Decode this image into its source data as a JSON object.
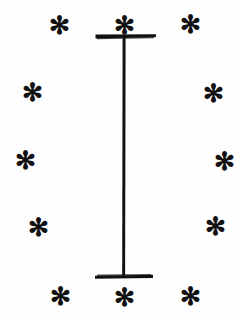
{
  "figure": {
    "background_color": "#fefefe",
    "ink_color": "#111111",
    "beam": {
      "name": "i-beam",
      "stroke_color": "#111111",
      "stem": {
        "x": 124,
        "y_top": 36,
        "y_bottom": 278,
        "width": 3
      },
      "top_flange": {
        "x_left": 95,
        "x_right": 156,
        "y": 36,
        "thickness": 4
      },
      "bottom_flange": {
        "x_left": 95,
        "x_right": 153,
        "y": 277,
        "thickness": 4
      }
    },
    "marker_glyph": "✻",
    "marker_count": 12,
    "markers": [
      {
        "name": "asterisk-top-left",
        "glyph": "✻",
        "x": 59,
        "y": 21,
        "size": 25
      },
      {
        "name": "asterisk-top-center",
        "glyph": "✻",
        "x": 124,
        "y": 21,
        "size": 25
      },
      {
        "name": "asterisk-top-right",
        "glyph": "✻",
        "x": 190,
        "y": 20,
        "size": 25
      },
      {
        "name": "asterisk-upper-left",
        "glyph": "✻",
        "x": 32,
        "y": 88,
        "size": 25
      },
      {
        "name": "asterisk-upper-right",
        "glyph": "✻",
        "x": 213,
        "y": 89,
        "size": 25
      },
      {
        "name": "asterisk-middle-left",
        "glyph": "✻",
        "x": 25,
        "y": 156,
        "size": 25
      },
      {
        "name": "asterisk-middle-right",
        "glyph": "✻",
        "x": 224,
        "y": 157,
        "size": 25
      },
      {
        "name": "asterisk-lower-left",
        "glyph": "✻",
        "x": 38,
        "y": 223,
        "size": 25
      },
      {
        "name": "asterisk-lower-right",
        "glyph": "✻",
        "x": 215,
        "y": 222,
        "size": 25
      },
      {
        "name": "asterisk-bottom-left",
        "glyph": "✻",
        "x": 60,
        "y": 292,
        "size": 25
      },
      {
        "name": "asterisk-bottom-center",
        "glyph": "✻",
        "x": 124,
        "y": 293,
        "size": 25
      },
      {
        "name": "asterisk-bottom-right",
        "glyph": "✻",
        "x": 190,
        "y": 292,
        "size": 25
      }
    ]
  }
}
